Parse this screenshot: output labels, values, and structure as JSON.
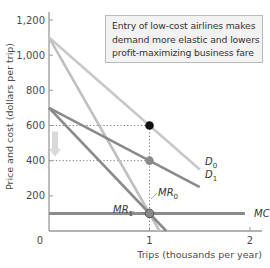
{
  "chart_data": {
    "type": "line",
    "title": "",
    "xlabel": "Trips (thousands per year)",
    "ylabel": "Price and cost (dollars per trip)",
    "xlim": [
      0,
      2.2
    ],
    "ylim": [
      0,
      1300
    ],
    "x_ticks": [
      {
        "value": 0,
        "label": "0"
      },
      {
        "value": 1,
        "label": "1"
      },
      {
        "value": 2,
        "label": "2"
      }
    ],
    "y_ticks": [
      {
        "value": 200,
        "label": "200"
      },
      {
        "value": 400,
        "label": "400"
      },
      {
        "value": 600,
        "label": "600"
      },
      {
        "value": 800,
        "label": "800"
      },
      {
        "value": 1000,
        "label": "1,000"
      },
      {
        "value": 1200,
        "label": "1,200"
      }
    ],
    "grid": false,
    "series": [
      {
        "id": "D0",
        "name": "D",
        "sub": "0",
        "color": "#c8c8c8",
        "points": [
          [
            0,
            1100
          ],
          [
            1.5,
            350
          ]
        ],
        "label_at": [
          1.55,
          340
        ]
      },
      {
        "id": "D1",
        "name": "D",
        "sub": "1",
        "color": "#8a8a8a",
        "points": [
          [
            0,
            700
          ],
          [
            1.5,
            250
          ]
        ],
        "label_at": [
          1.55,
          240
        ]
      },
      {
        "id": "MR0",
        "name": "MR",
        "sub": "0",
        "color": "#c0c0c0",
        "points": [
          [
            0,
            1100
          ],
          [
            1.1,
            0
          ]
        ],
        "label_at": [
          1.05,
          210
        ]
      },
      {
        "id": "MR1",
        "name": "MR",
        "sub": "1",
        "color": "#8a8a8a",
        "points": [
          [
            0,
            700
          ],
          [
            1.1667,
            0
          ]
        ],
        "label_at": [
          0.67,
          150
        ]
      },
      {
        "id": "MC",
        "name": "MC",
        "sub": "",
        "color": "#8a8a8a",
        "points": [
          [
            0,
            100
          ],
          [
            1.95,
            100
          ]
        ],
        "label_at": [
          2.0,
          100
        ]
      }
    ],
    "points": [
      {
        "id": "fare-before",
        "x": 1,
        "y": 600,
        "color": "#111111"
      },
      {
        "id": "fare-after",
        "x": 1,
        "y": 400,
        "color": "#8a8a8a"
      },
      {
        "id": "mr-equals-mc",
        "x": 1,
        "y": 100,
        "color": "#8a8a8a"
      }
    ],
    "guides": [
      {
        "from": [
          0,
          600
        ],
        "to": [
          1,
          600
        ]
      },
      {
        "from": [
          1,
          600
        ],
        "to": [
          1,
          0
        ]
      },
      {
        "from": [
          0,
          400
        ],
        "to": [
          1,
          400
        ]
      }
    ],
    "arrow": {
      "from": 600,
      "to": 400,
      "x": 0.04,
      "color": "#d9d9d9"
    },
    "annotation": {
      "lines": [
        "Entry of low-cost airlines makes",
        "demand more elastic and lowers",
        "profit-maximizing business fare"
      ]
    }
  }
}
